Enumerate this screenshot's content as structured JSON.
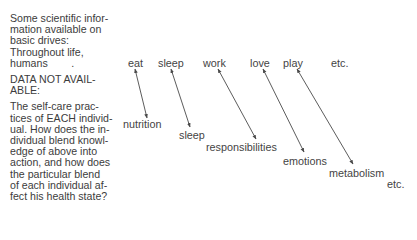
{
  "left_text": {
    "available_heading": "Some scientific infor-",
    "available_lines": [
      "Some scientific infor-",
      "mation available on",
      "basic drives:",
      "Throughout life,",
      "humans        ."
    ],
    "not_available_lines": [
      "DATA NOT AVAIL-",
      "ABLE:"
    ],
    "question_lines": [
      "The self-care prac-",
      "tices of EACH individ-",
      "ual. How does the in-",
      "dividual blend knowl-",
      "edge of above into",
      "action, and how does",
      "the particular blend",
      "of each individual af-",
      "fect his health state?"
    ]
  },
  "drives": [
    {
      "label": "eat",
      "x": 128,
      "y": 57
    },
    {
      "label": "sleep",
      "x": 158,
      "y": 57
    },
    {
      "label": "work",
      "x": 203,
      "y": 57
    },
    {
      "label": "love",
      "x": 250,
      "y": 57
    },
    {
      "label": "play",
      "x": 283,
      "y": 57
    },
    {
      "label": "etc.",
      "x": 331,
      "y": 57
    }
  ],
  "needs": [
    {
      "label": "nutrition",
      "x": 123,
      "y": 118
    },
    {
      "label": "sleep",
      "x": 179,
      "y": 129
    },
    {
      "label": "responsibilities",
      "x": 206,
      "y": 141
    },
    {
      "label": "emotions",
      "x": 283,
      "y": 155
    },
    {
      "label": "metabolism",
      "x": 329,
      "y": 167
    },
    {
      "label": "etc.",
      "x": 387,
      "y": 178
    }
  ],
  "connectors": [
    {
      "from": "eat",
      "to": "nutrition",
      "x1": 135,
      "y1": 69,
      "x2": 147,
      "y2": 118
    },
    {
      "from": "sleep",
      "to": "sleep",
      "x1": 171,
      "y1": 69,
      "x2": 190,
      "y2": 127
    },
    {
      "from": "work",
      "to": "responsibilities",
      "x1": 218,
      "y1": 69,
      "x2": 256,
      "y2": 139
    },
    {
      "from": "love",
      "to": "emotions",
      "x1": 263,
      "y1": 69,
      "x2": 304,
      "y2": 152
    },
    {
      "from": "play",
      "to": "metabolism",
      "x1": 297,
      "y1": 69,
      "x2": 353,
      "y2": 164
    }
  ],
  "line_color": "#4a4a4a"
}
